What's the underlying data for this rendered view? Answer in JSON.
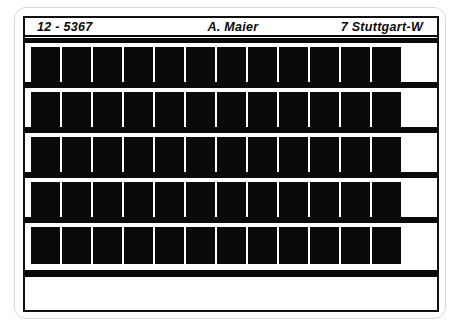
{
  "document": {
    "kind": "microfiche-card",
    "header": {
      "id": "12 - 5367",
      "name": "A. Maier",
      "location": "7 Stuttgart-W"
    },
    "grid": {
      "row_count": 5,
      "columns_per_row": 12,
      "frame_fill_color": "#0a0a0a",
      "card_border_color": "#111111",
      "sheet_border_color": "#d8d8d8",
      "background_color": "#ffffff",
      "rows": [
        {
          "index": 1,
          "frames": 12
        },
        {
          "index": 2,
          "frames": 12
        },
        {
          "index": 3,
          "frames": 12
        },
        {
          "index": 4,
          "frames": 12
        },
        {
          "index": 5,
          "frames": 12
        }
      ]
    }
  }
}
